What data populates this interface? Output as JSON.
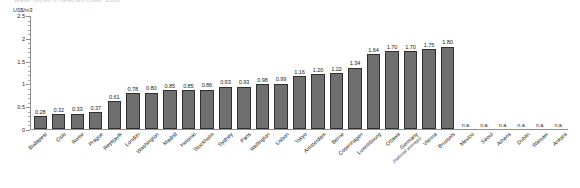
{
  "chart_data": {
    "type": "bar",
    "title": "Water prices in selected cities, 2008",
    "ylabel": "US$/m3",
    "xlabel": "",
    "ylim": [
      0,
      2.5
    ],
    "yticks": [
      "0",
      "0.5",
      "1",
      "1.5",
      "2",
      "2.5"
    ],
    "ytick_values": [
      0,
      0.5,
      1,
      1.5,
      2,
      2.5
    ],
    "grid": false,
    "legend": false,
    "na_label": "n.a.",
    "categories": [
      "Budapest",
      "Oslo",
      "Rome",
      "Prague",
      "Reykjavik",
      "London",
      "Washington",
      "Madrid",
      "Helsinki",
      "Stockholm",
      "Sydney",
      "Paris",
      "Wellington",
      "Lisbon",
      "Tokyo",
      "Amsterdam",
      "Berne",
      "Copenhagen",
      "Luxembourg",
      "Ottawa",
      "Germany",
      "Vienna",
      "Brussels",
      "Mexico",
      "Seoul",
      "Athens",
      "Dublin",
      "Warsaw",
      "Ankara"
    ],
    "category_sublabels": [
      "",
      "",
      "",
      "",
      "",
      "",
      "",
      "",
      "",
      "",
      "",
      "",
      "",
      "",
      "",
      "",
      "",
      "",
      "",
      "",
      "(national average)",
      "",
      "",
      "",
      "",
      "",
      "",
      "",
      ""
    ],
    "values": [
      0.28,
      0.32,
      0.33,
      0.37,
      0.61,
      0.78,
      0.8,
      0.85,
      0.85,
      0.86,
      0.93,
      0.93,
      0.98,
      0.99,
      1.16,
      1.2,
      1.22,
      1.34,
      1.64,
      1.7,
      1.7,
      1.75,
      1.8,
      null,
      null,
      null,
      null,
      null,
      null
    ],
    "value_labels": [
      "0.28",
      "0.32",
      "0.33",
      "0.37",
      "0.61",
      "0.78",
      "0.80",
      "0.85",
      "0.85",
      "0.86",
      "0.93",
      "0.93",
      "0.98",
      "0.99",
      "1.16",
      "1.20",
      "1.22",
      "1.34",
      "1.64",
      "1.70",
      "1.70",
      "1.75",
      "1.80",
      "n.a.",
      "n.a.",
      "n.a.",
      "n.a.",
      "n.a.",
      "n.a."
    ],
    "bar_color": "#6f6f6f",
    "bar_border_color": "#2f2f2f",
    "axis_color": "#8e8e8e"
  }
}
